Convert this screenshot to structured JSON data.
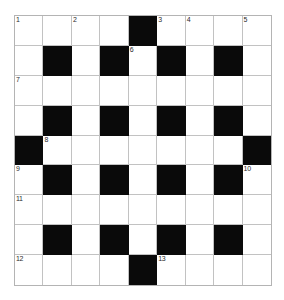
{
  "puzzle": {
    "title": "Crossword Grid",
    "rows": 9,
    "columns": 9,
    "colors": {
      "background": "#ffffff",
      "block": "#0a0a0a",
      "grid_line": "#c2c2c2",
      "outer_border": "#b4b4b4",
      "number_text": "#2b2b2b"
    },
    "grid": [
      [
        {
          "type": "open",
          "number": "1",
          "letter": ""
        },
        {
          "type": "open",
          "number": "",
          "letter": ""
        },
        {
          "type": "open",
          "number": "2",
          "letter": ""
        },
        {
          "type": "open",
          "number": "",
          "letter": ""
        },
        {
          "type": "block",
          "number": "",
          "letter": ""
        },
        {
          "type": "open",
          "number": "3",
          "letter": ""
        },
        {
          "type": "open",
          "number": "4",
          "letter": ""
        },
        {
          "type": "open",
          "number": "",
          "letter": ""
        },
        {
          "type": "open",
          "number": "5",
          "letter": ""
        }
      ],
      [
        {
          "type": "open",
          "number": "",
          "letter": ""
        },
        {
          "type": "block",
          "number": "",
          "letter": ""
        },
        {
          "type": "open",
          "number": "",
          "letter": ""
        },
        {
          "type": "block",
          "number": "",
          "letter": ""
        },
        {
          "type": "open",
          "number": "6",
          "letter": ""
        },
        {
          "type": "block",
          "number": "",
          "letter": ""
        },
        {
          "type": "open",
          "number": "",
          "letter": ""
        },
        {
          "type": "block",
          "number": "",
          "letter": ""
        },
        {
          "type": "open",
          "number": "",
          "letter": ""
        }
      ],
      [
        {
          "type": "open",
          "number": "7",
          "letter": ""
        },
        {
          "type": "open",
          "number": "",
          "letter": ""
        },
        {
          "type": "open",
          "number": "",
          "letter": ""
        },
        {
          "type": "open",
          "number": "",
          "letter": ""
        },
        {
          "type": "open",
          "number": "",
          "letter": ""
        },
        {
          "type": "open",
          "number": "",
          "letter": ""
        },
        {
          "type": "open",
          "number": "",
          "letter": ""
        },
        {
          "type": "open",
          "number": "",
          "letter": ""
        },
        {
          "type": "open",
          "number": "",
          "letter": ""
        }
      ],
      [
        {
          "type": "open",
          "number": "",
          "letter": ""
        },
        {
          "type": "block",
          "number": "",
          "letter": ""
        },
        {
          "type": "open",
          "number": "",
          "letter": ""
        },
        {
          "type": "block",
          "number": "",
          "letter": ""
        },
        {
          "type": "open",
          "number": "",
          "letter": ""
        },
        {
          "type": "block",
          "number": "",
          "letter": ""
        },
        {
          "type": "open",
          "number": "",
          "letter": ""
        },
        {
          "type": "block",
          "number": "",
          "letter": ""
        },
        {
          "type": "open",
          "number": "",
          "letter": ""
        }
      ],
      [
        {
          "type": "block",
          "number": "",
          "letter": ""
        },
        {
          "type": "open",
          "number": "8",
          "letter": ""
        },
        {
          "type": "open",
          "number": "",
          "letter": ""
        },
        {
          "type": "open",
          "number": "",
          "letter": ""
        },
        {
          "type": "open",
          "number": "",
          "letter": ""
        },
        {
          "type": "open",
          "number": "",
          "letter": ""
        },
        {
          "type": "open",
          "number": "",
          "letter": ""
        },
        {
          "type": "open",
          "number": "",
          "letter": ""
        },
        {
          "type": "block",
          "number": "",
          "letter": ""
        }
      ],
      [
        {
          "type": "open",
          "number": "9",
          "letter": ""
        },
        {
          "type": "block",
          "number": "",
          "letter": ""
        },
        {
          "type": "open",
          "number": "",
          "letter": ""
        },
        {
          "type": "block",
          "number": "",
          "letter": ""
        },
        {
          "type": "open",
          "number": "",
          "letter": ""
        },
        {
          "type": "block",
          "number": "",
          "letter": ""
        },
        {
          "type": "open",
          "number": "",
          "letter": ""
        },
        {
          "type": "block",
          "number": "",
          "letter": ""
        },
        {
          "type": "open",
          "number": "10",
          "letter": ""
        }
      ],
      [
        {
          "type": "open",
          "number": "11",
          "letter": ""
        },
        {
          "type": "open",
          "number": "",
          "letter": ""
        },
        {
          "type": "open",
          "number": "",
          "letter": ""
        },
        {
          "type": "open",
          "number": "",
          "letter": ""
        },
        {
          "type": "open",
          "number": "",
          "letter": ""
        },
        {
          "type": "open",
          "number": "",
          "letter": ""
        },
        {
          "type": "open",
          "number": "",
          "letter": ""
        },
        {
          "type": "open",
          "number": "",
          "letter": ""
        },
        {
          "type": "open",
          "number": "",
          "letter": ""
        }
      ],
      [
        {
          "type": "open",
          "number": "",
          "letter": ""
        },
        {
          "type": "block",
          "number": "",
          "letter": ""
        },
        {
          "type": "open",
          "number": "",
          "letter": ""
        },
        {
          "type": "block",
          "number": "",
          "letter": ""
        },
        {
          "type": "open",
          "number": "",
          "letter": ""
        },
        {
          "type": "block",
          "number": "",
          "letter": ""
        },
        {
          "type": "open",
          "number": "",
          "letter": ""
        },
        {
          "type": "block",
          "number": "",
          "letter": ""
        },
        {
          "type": "open",
          "number": "",
          "letter": ""
        }
      ],
      [
        {
          "type": "open",
          "number": "12",
          "letter": ""
        },
        {
          "type": "open",
          "number": "",
          "letter": ""
        },
        {
          "type": "open",
          "number": "",
          "letter": ""
        },
        {
          "type": "open",
          "number": "",
          "letter": ""
        },
        {
          "type": "block",
          "number": "",
          "letter": ""
        },
        {
          "type": "open",
          "number": "13",
          "letter": ""
        },
        {
          "type": "open",
          "number": "",
          "letter": ""
        },
        {
          "type": "open",
          "number": "",
          "letter": ""
        },
        {
          "type": "open",
          "number": "",
          "letter": ""
        }
      ]
    ]
  }
}
